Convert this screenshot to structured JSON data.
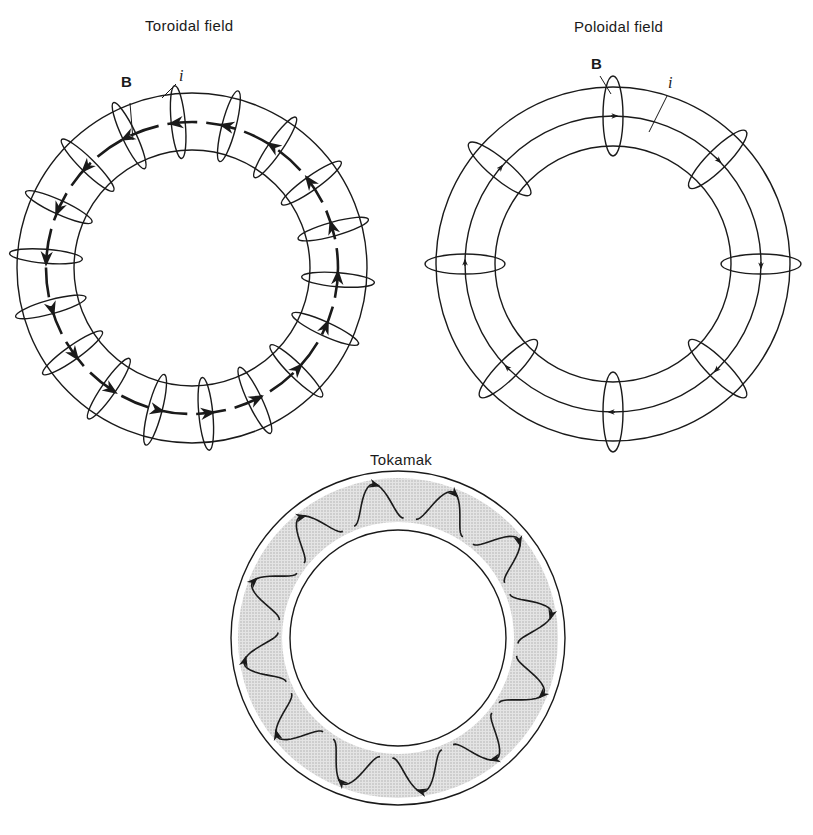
{
  "figure": {
    "panels": [
      {
        "id": "toroidal",
        "title": "Toroidal field",
        "labels": {
          "field": "B",
          "current": "i"
        },
        "center": [
          192,
          268
        ],
        "outer_radius": 175,
        "inner_radius": 118,
        "coil_count": 18,
        "field_direction": "counterclockwise"
      },
      {
        "id": "poloidal",
        "title": "Poloidal field",
        "labels": {
          "field": "B",
          "current": "i"
        },
        "center": [
          613,
          264
        ],
        "outer_radius": 177,
        "middle_radius": 148,
        "inner_radius": 118,
        "loop_count": 8
      },
      {
        "id": "tokamak",
        "title": "Tokamak",
        "center": [
          398,
          638
        ],
        "outer_radius": 167,
        "inner_radius": 108,
        "helix_count": 12,
        "plasma_shading": "#d8d8d8"
      }
    ],
    "colors": {
      "line": "#1a1a1a",
      "background": "#ffffff",
      "shade": "#d6d6d6"
    }
  }
}
